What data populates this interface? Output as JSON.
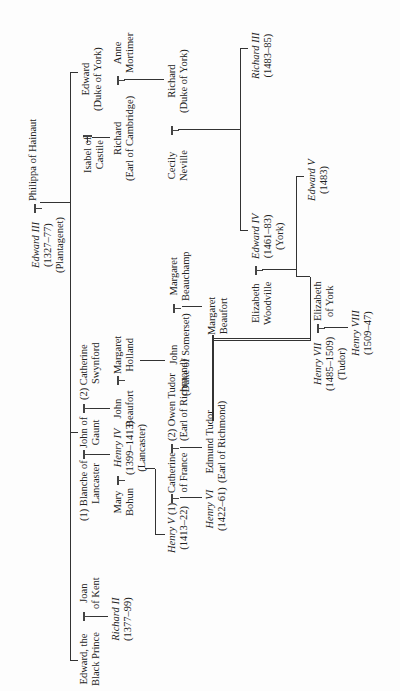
{
  "chart": {
    "title_hint": "Genealogical table: Houses of Plantagenet, Lancaster, York and Tudor",
    "people": {
      "edward3": {
        "name": "Edward III",
        "dates": "(1327–77)",
        "house": "(Plantagenet)"
      },
      "philippa": {
        "name": "Philippa of Hainaut"
      },
      "black_prince": {
        "line1": "Edward, the",
        "line2": "Black Prince"
      },
      "joan": {
        "line1": "Joan",
        "line2": "of Kent"
      },
      "richard2": {
        "name": "Richard II",
        "dates": "(1377–99)"
      },
      "blanche": {
        "prefix": "(1)",
        "line1": "Blanche of",
        "line2": "Lancaster"
      },
      "john_gaunt": {
        "line1": "John of",
        "line2": "Gaunt"
      },
      "catherine_swynford": {
        "prefix": "(2)",
        "line1": "Catherine",
        "line2": "Swynford"
      },
      "mary_bohun": {
        "line1": "Mary",
        "line2": "Bohun"
      },
      "henry4": {
        "name": "Henry IV",
        "dates": "(1399–1413)",
        "house": "(Lancaster)"
      },
      "john_beaufort": {
        "line1": "John",
        "line2": "Beaufort"
      },
      "margaret_holland": {
        "line1": "Margaret",
        "line2": "Holland"
      },
      "henry5": {
        "name": "Henry V",
        "marker": "(1)",
        "dates": "(1413–22)"
      },
      "catherine_france": {
        "line1": "Catherine",
        "line2": "of France"
      },
      "owen_tudor": {
        "prefix": "(2)",
        "line1": "Owen Tudor",
        "line2": "(Earl of Richmond)"
      },
      "john_somerset": {
        "line1": "John",
        "line2": "(Duke of Somerset)"
      },
      "margaret_beauchamp": {
        "line1": "Margaret",
        "line2": "Beauchamp"
      },
      "henry6": {
        "name": "Henry VI",
        "dates": "(1422–61)"
      },
      "edmund_tudor": {
        "line1": "Edmund Tudor",
        "line2": "(Earl of Richmond)"
      },
      "margaret_beaufort": {
        "line1": "Margaret",
        "line2": "Beaufort"
      },
      "edward_york": {
        "line1": "Edward",
        "line2": "(Duke of York)"
      },
      "isabel": {
        "line1": "Isabel of",
        "line2": "Castile"
      },
      "richard_cambridge": {
        "line1": "Richard",
        "line2": "(Earl of Cambridge)"
      },
      "anne_mortimer": {
        "line1": "Anne",
        "line2": "Mortimer"
      },
      "cecily": {
        "line1": "Cecily",
        "line2": "Neville"
      },
      "richard_york": {
        "line1": "Richard",
        "line2": "(Duke of York)"
      },
      "richard3": {
        "name": "Richard III",
        "dates": "(1483–85)"
      },
      "elizabeth_woodville": {
        "line1": "Elizabeth",
        "line2": "Woodville"
      },
      "edward4": {
        "name": "Edward IV",
        "dates": "(1461–83)",
        "house": "(York)"
      },
      "edward5": {
        "name": "Edward V",
        "dates": "(1483)"
      },
      "henry7": {
        "name": "Henry VII",
        "dates": "(1485–1509)",
        "house": "(Tudor)"
      },
      "elizabeth_york": {
        "line1": "Elizabeth",
        "line2": "of York"
      },
      "henry8": {
        "name": "Henry VIII",
        "dates": "(1509–47)"
      }
    }
  }
}
